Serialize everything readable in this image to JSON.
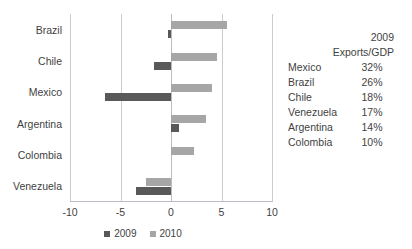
{
  "chart_data": {
    "type": "bar",
    "orientation": "horizontal",
    "title": "",
    "xlabel": "",
    "ylabel": "",
    "xlim": [
      -10,
      10
    ],
    "xticks": [
      -10,
      -5,
      0,
      5,
      10
    ],
    "xtick_labels": [
      "-10",
      "-5",
      "0",
      "5",
      "10"
    ],
    "grid": true,
    "legend_position": "bottom-center",
    "categories": [
      "Brazil",
      "Chile",
      "Mexico",
      "Argentina",
      "Colombia",
      "Venezuela"
    ],
    "series": [
      {
        "name": "2009",
        "color": "#595959",
        "values": [
          -0.3,
          -1.7,
          -6.5,
          0.8,
          0.0,
          -3.5
        ]
      },
      {
        "name": "2010",
        "color": "#a6a6a6",
        "values": [
          5.5,
          4.6,
          4.1,
          3.5,
          2.3,
          -2.5
        ]
      }
    ]
  },
  "legend": {
    "items": [
      {
        "label": "2009",
        "color": "#595959"
      },
      {
        "label": "2010",
        "color": "#a6a6a6"
      }
    ]
  },
  "side_table": {
    "header_line1": "2009",
    "header_line2": "Exports/GDP",
    "rows": [
      {
        "country": "Mexico",
        "value": "32%"
      },
      {
        "country": "Brazil",
        "value": "26%"
      },
      {
        "country": "Chile",
        "value": "18%"
      },
      {
        "country": "Venezuela",
        "value": "17%"
      },
      {
        "country": "Argentina",
        "value": "14%"
      },
      {
        "country": "Colombia",
        "value": "10%"
      }
    ]
  },
  "colors": {
    "series_2009": "#595959",
    "series_2010": "#a6a6a6",
    "gridline": "#c8cdd4",
    "text": "#3f3f3f"
  }
}
